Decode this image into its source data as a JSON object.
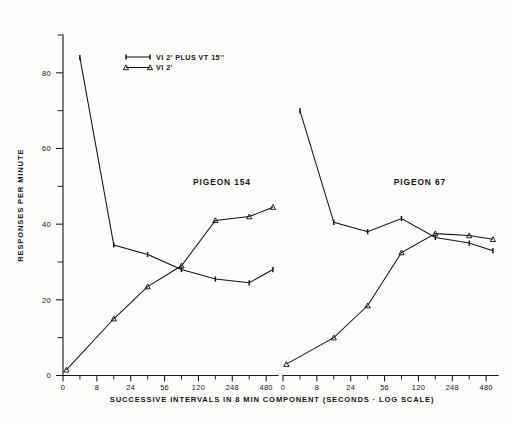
{
  "figure": {
    "background_color": "#fdfdfc",
    "ink_color": "#141414"
  },
  "axes": {
    "y_axis_title": "RESPONSES PER MINUTE",
    "x_axis_title": "SUCCESSIVE INTERVALS IN 8 MIN COMPONENT (SECONDS · LOG SCALE)"
  },
  "legend": {
    "entries": [
      {
        "label": "VI 2' PLUS VT 15''",
        "marker": "bar"
      },
      {
        "label": "VI 2'",
        "marker": "triangle"
      }
    ]
  },
  "panels": [
    {
      "title": "PIGEON 154"
    },
    {
      "title": "PIGEON 67"
    }
  ],
  "chart_data": [
    {
      "type": "line",
      "title": "PIGEON 154",
      "xlabel": "SUCCESSIVE INTERVALS IN 8 MIN COMPONENT (SECONDS · LOG SCALE)",
      "ylabel": "RESPONSES PER MINUTE",
      "x_scale": "log",
      "x_tick_labels": [
        "0",
        "8",
        "24",
        "56",
        "120",
        "248",
        "480"
      ],
      "y_ticks": [
        0,
        20,
        40,
        60,
        80
      ],
      "y_minor_ticks": [
        10,
        30,
        50,
        70,
        90
      ],
      "ylim": [
        0,
        90
      ],
      "grid": false,
      "legend_position": "top-left",
      "series": [
        {
          "name": "VI 2' PLUS VT 15''",
          "marker": "bar",
          "x": [
            "4",
            "14",
            "40",
            "88",
            "180",
            "370",
            "480"
          ],
          "x_index": [
            0.5,
            1.5,
            2.5,
            3.5,
            4.5,
            5.5,
            6.2
          ],
          "values": [
            84,
            34.5,
            32,
            28,
            25.5,
            24.5,
            28
          ]
        },
        {
          "name": "VI 2'",
          "marker": "triangle",
          "x": [
            "0",
            "14",
            "40",
            "88",
            "180",
            "370",
            "480"
          ],
          "x_index": [
            0.1,
            1.5,
            2.5,
            3.5,
            4.5,
            5.5,
            6.2
          ],
          "values": [
            1.5,
            15,
            23.5,
            29,
            41,
            42,
            44.5
          ]
        }
      ]
    },
    {
      "type": "line",
      "title": "PIGEON 67",
      "xlabel": "SUCCESSIVE INTERVALS IN 8 MIN COMPONENT (SECONDS · LOG SCALE)",
      "ylabel": "RESPONSES PER MINUTE",
      "x_scale": "log",
      "x_tick_labels": [
        "0",
        "8",
        "24",
        "56",
        "120",
        "248",
        "480"
      ],
      "y_ticks": [
        0,
        20,
        40,
        60,
        80
      ],
      "y_minor_ticks": [
        10,
        30,
        50,
        70,
        90
      ],
      "ylim": [
        0,
        90
      ],
      "grid": false,
      "legend_position": "none",
      "series": [
        {
          "name": "VI 2' PLUS VT 15''",
          "marker": "bar",
          "x": [
            "4",
            "14",
            "40",
            "88",
            "180",
            "370",
            "480"
          ],
          "x_index": [
            0.5,
            1.5,
            2.5,
            3.5,
            4.5,
            5.5,
            6.2
          ],
          "values": [
            70,
            40.5,
            38,
            41.5,
            36.5,
            35,
            33
          ]
        },
        {
          "name": "VI 2'",
          "marker": "triangle",
          "x": [
            "0",
            "14",
            "40",
            "88",
            "180",
            "370",
            "480"
          ],
          "x_index": [
            0.1,
            1.5,
            2.5,
            3.5,
            4.5,
            5.5,
            6.2
          ],
          "values": [
            3,
            10,
            18.5,
            32.5,
            37.5,
            37,
            36
          ]
        }
      ]
    }
  ]
}
